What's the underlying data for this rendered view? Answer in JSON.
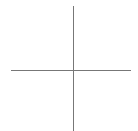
{
  "diagram": {
    "type": "crosshair-axes",
    "background_color": "#ffffff",
    "line_color": "#777777",
    "line_width": 1,
    "horizontal_axis": {
      "x1": 11,
      "x2": 131,
      "y": 70.5
    },
    "vertical_axis": {
      "x": 73.5,
      "y1": 6,
      "y2": 131
    }
  }
}
